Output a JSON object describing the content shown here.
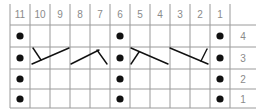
{
  "chart": {
    "column_labels": [
      "11",
      "10",
      "9",
      "8",
      "7",
      "6",
      "5",
      "4",
      "3",
      "2",
      "1"
    ],
    "row_labels": [
      "4",
      "3",
      "2",
      "1"
    ],
    "purl_columns": [
      11,
      6,
      1
    ],
    "cables": [
      {
        "row": 3,
        "columns": [
          10,
          8
        ],
        "type": "right-cross"
      },
      {
        "row": 3,
        "columns": [
          7,
          9
        ],
        "type": "left-cross"
      },
      {
        "row": 3,
        "columns": [
          5,
          3
        ],
        "type": "right-cross-b"
      },
      {
        "row": 3,
        "columns": [
          4,
          2
        ],
        "type": "left-cross-b"
      }
    ],
    "colors": {
      "grid": "#9a9a9a",
      "symbol": "#111111",
      "label": "#8a8a8a"
    }
  }
}
